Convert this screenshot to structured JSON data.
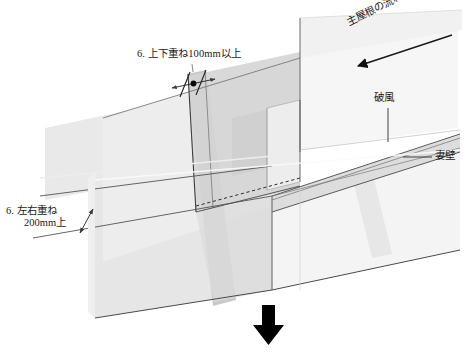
{
  "figure": {
    "title": "",
    "kind": "architectural-construction-detail"
  },
  "labels": {
    "upper_lower_overlap": "6. 上下重ね100mm以上",
    "left_right_overlap_line1": "6. 左右重ね",
    "left_right_overlap_line2": "200mm上",
    "bargeboard": "破風",
    "gable_wall": "妻壁",
    "main_roof_flow": "主屋根の流れ方向"
  },
  "annotations": {
    "dimension_dot_marker": "dimension-tick-dot",
    "direction_arrow": "flow-direction-arrow",
    "double_arrow": "double-headed-dimension-arrow",
    "bottom_arrow": "down-arrow-glyph"
  },
  "colors": {
    "line": "#3c3c3c",
    "outline": "#555555",
    "plane_light": "#e8e8e8",
    "plane_lighter": "#f2f2f2",
    "plane_pale": "#f7f7f7",
    "plane_mid": "#d8d8d8",
    "plane_dark": "#c6c6c6",
    "plane_darker": "#b8b8b8",
    "arrow_black": "#000000",
    "background": "#ffffff"
  },
  "geometry": {
    "view": "isometric-oblique",
    "planes": [
      {
        "name": "left-gable-wall",
        "tone": "plane_light"
      },
      {
        "name": "right-gable-wall",
        "tone": "plane_pale"
      },
      {
        "name": "main-roof-slope",
        "tone": "plane_lighter"
      },
      {
        "name": "underlayment-strip-vertical",
        "tone": "plane_dark"
      },
      {
        "name": "underlayment-sheet-diagonal",
        "tone": "plane_mid"
      },
      {
        "name": "bargeboard-band",
        "tone": "plane_mid"
      }
    ]
  }
}
